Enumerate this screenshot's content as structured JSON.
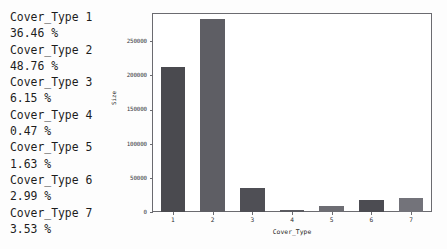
{
  "listing": {
    "lines": [
      "Cover_Type 1",
      "36.46 %",
      "Cover_Type 2",
      "48.76 %",
      "Cover_Type 3",
      "6.15 %",
      "Cover_Type 4",
      "0.47 %",
      "Cover_Type 5",
      "1.63 %",
      "Cover_Type 6",
      "2.99 %",
      "Cover_Type 7",
      "3.53 %"
    ]
  },
  "chart_data": {
    "type": "bar",
    "title": "",
    "xlabel": "Cover_Type",
    "ylabel": "Size",
    "categories": [
      "1",
      "2",
      "3",
      "4",
      "5",
      "6",
      "7"
    ],
    "values": [
      211840,
      283301,
      35754,
      2747,
      9493,
      17367,
      20510
    ],
    "percentages": [
      36.46,
      48.76,
      6.15,
      0.47,
      1.63,
      2.99,
      3.53
    ],
    "ylim": [
      0,
      290000
    ],
    "yticks": [
      0,
      50000,
      100000,
      150000,
      200000,
      250000
    ],
    "ytick_labels": [
      "0",
      "50000",
      "100000",
      "150000",
      "200000",
      "250000"
    ],
    "xtick_labels": [
      "1",
      "2",
      "3",
      "4",
      "5",
      "6",
      "7"
    ],
    "grid": false,
    "legend": false,
    "bar_colors": [
      "#4a4a4f",
      "#5e5e64",
      "#4f4f55",
      "#5a5a60",
      "#6d6d73",
      "#4c4c52",
      "#73737a"
    ],
    "frame_color": "#6b6b70",
    "background": "#ffffff"
  }
}
